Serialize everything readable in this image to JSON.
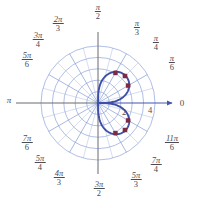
{
  "figure": {
    "title": "",
    "kind": "polar-plot"
  },
  "colors": {
    "grid": "#8096d4",
    "grid_minor": "#9aaddc",
    "axis": "#6b6b73",
    "curve": "#3f4fa6",
    "point": "#7d2b44",
    "label": "#4b4b54",
    "background": "#ffffff"
  },
  "axes": {
    "center": {
      "x": 98,
      "y": 103
    },
    "outer_radius": 57,
    "radial_ticks": [
      {
        "label": "2",
        "r": 2,
        "px": 124,
        "py": 112
      },
      {
        "label": "4",
        "r": 4,
        "px": 150,
        "py": 110
      }
    ],
    "radial_max": 5,
    "circle_count": 5,
    "grid": true,
    "angle_step_major": "pi/6",
    "angle_step_minor": "pi/12"
  },
  "axis_labels": {
    "right": "0",
    "left": "π"
  },
  "angle_labels": [
    {
      "name": "pi-over-2",
      "num": "π",
      "den": "2",
      "x": 98,
      "y": 12,
      "frac": true
    },
    {
      "name": "2pi-over-3",
      "num": "2π",
      "den": "3",
      "x": 58,
      "y": 24,
      "frac": true
    },
    {
      "name": "3pi-over-4",
      "num": "3π",
      "den": "4",
      "x": 38,
      "y": 40,
      "frac": true
    },
    {
      "name": "5pi-over-6",
      "num": "5π",
      "den": "6",
      "x": 27,
      "y": 60,
      "frac": true
    },
    {
      "name": "pi",
      "num": "π",
      "den": "",
      "x": 9,
      "y": 100,
      "frac": false
    },
    {
      "name": "7pi-over-6",
      "num": "7π",
      "den": "6",
      "x": 27,
      "y": 143,
      "frac": true
    },
    {
      "name": "5pi-over-4",
      "num": "5π",
      "den": "4",
      "x": 40,
      "y": 163,
      "frac": true
    },
    {
      "name": "4pi-over-3",
      "num": "4π",
      "den": "3",
      "x": 59,
      "y": 178,
      "frac": true
    },
    {
      "name": "3pi-over-2",
      "num": "3π",
      "den": "2",
      "x": 99,
      "y": 189,
      "frac": true
    },
    {
      "name": "5pi-over-3",
      "num": "5π",
      "den": "3",
      "x": 136,
      "y": 180,
      "frac": true
    },
    {
      "name": "7pi-over-4",
      "num": "7π",
      "den": "4",
      "x": 156,
      "y": 165,
      "frac": true
    },
    {
      "name": "11pi-over-6",
      "num": "11π",
      "den": "6",
      "x": 172,
      "y": 143,
      "frac": true
    },
    {
      "name": "pi-over-6",
      "num": "π",
      "den": "6",
      "x": 172,
      "y": 63,
      "frac": true
    },
    {
      "name": "pi-over-4",
      "num": "π",
      "den": "4",
      "x": 156,
      "y": 43,
      "frac": true
    },
    {
      "name": "pi-over-3",
      "num": "π",
      "den": "3",
      "x": 137,
      "y": 28,
      "frac": true
    }
  ],
  "chart_data": {
    "type": "line",
    "coordinate_system": "polar",
    "title": "",
    "xlabel": "",
    "ylabel": "",
    "rlim": [
      0,
      5
    ],
    "theta_labels": [
      "0",
      "π/6",
      "π/4",
      "π/3",
      "π/2",
      "2π/3",
      "3π/4",
      "5π/6",
      "π",
      "7π/6",
      "5π/4",
      "4π/3",
      "3π/2",
      "5π/3",
      "7π/4",
      "11π/6"
    ],
    "r_ticks": [
      2,
      4
    ],
    "grid": true,
    "legend": "none",
    "curve_description": "figure-eight lemniscate r^2 = a^2 sin(2theta) traced in quadrants I and IV",
    "series": [
      {
        "name": "r^2 = a^2 sin(2theta)",
        "color": "#3f4fa6",
        "closed": true,
        "upper_loop_polar": [
          {
            "theta_deg": 0,
            "r": 0.0
          },
          {
            "theta_deg": 10,
            "r": 1.85
          },
          {
            "theta_deg": 20,
            "r": 2.55
          },
          {
            "theta_deg": 30,
            "r": 3.0
          },
          {
            "theta_deg": 40,
            "r": 3.3
          },
          {
            "theta_deg": 45,
            "r": 3.4
          },
          {
            "theta_deg": 50,
            "r": 3.3
          },
          {
            "theta_deg": 60,
            "r": 3.0
          },
          {
            "theta_deg": 70,
            "r": 2.55
          },
          {
            "theta_deg": 80,
            "r": 1.85
          },
          {
            "theta_deg": 90,
            "r": 0.0
          }
        ],
        "lower_loop_polar": [
          {
            "theta_deg": 270,
            "r": 0.0
          },
          {
            "theta_deg": 280,
            "r": 1.85
          },
          {
            "theta_deg": 290,
            "r": 2.55
          },
          {
            "theta_deg": 300,
            "r": 3.0
          },
          {
            "theta_deg": 310,
            "r": 3.3
          },
          {
            "theta_deg": 315,
            "r": 3.4
          },
          {
            "theta_deg": 320,
            "r": 3.3
          },
          {
            "theta_deg": 330,
            "r": 3.0
          },
          {
            "theta_deg": 340,
            "r": 2.55
          },
          {
            "theta_deg": 350,
            "r": 1.85
          },
          {
            "theta_deg": 360,
            "r": 0.0
          }
        ]
      }
    ],
    "marked_points": [
      {
        "name": "upper-left",
        "theta_deg": 60,
        "r": 3.05,
        "px": 118,
        "py": 64
      },
      {
        "name": "upper-right",
        "theta_deg": 45,
        "r": 3.35,
        "px": 132,
        "py": 70
      },
      {
        "name": "upper-outer",
        "theta_deg": 30,
        "r": 3.05,
        "px": 139,
        "py": 85
      },
      {
        "name": "lower-outer",
        "theta_deg": 330,
        "r": 3.05,
        "px": 139,
        "py": 122
      },
      {
        "name": "lower-right",
        "theta_deg": 315,
        "r": 3.35,
        "px": 133,
        "py": 137
      },
      {
        "name": "lower-left",
        "theta_deg": 300,
        "r": 3.05,
        "px": 119,
        "py": 143
      }
    ]
  }
}
